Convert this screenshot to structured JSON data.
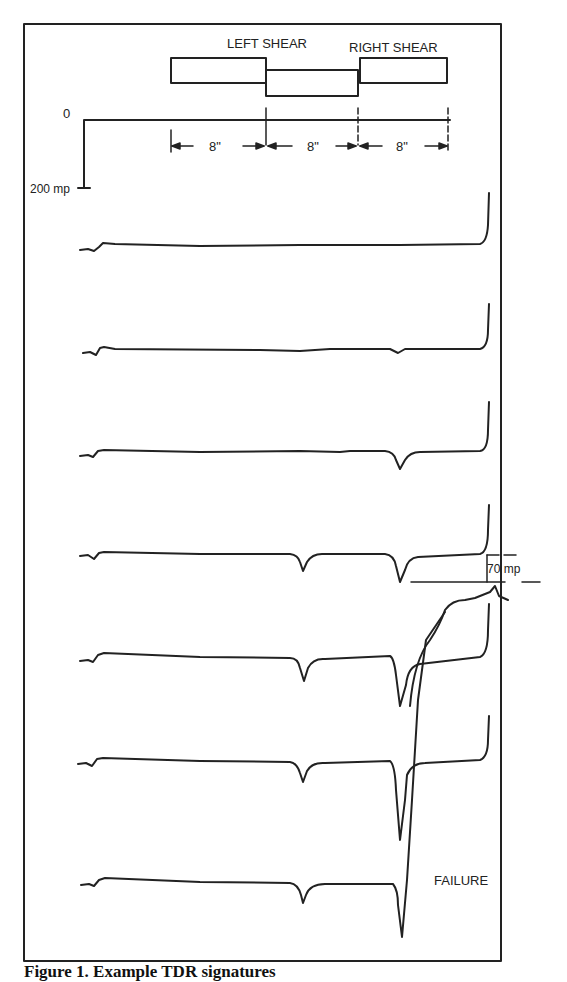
{
  "labels": {
    "left_shear": "LEFT SHEAR",
    "right_shear": "RIGHT SHEAR",
    "zero": "0",
    "scale_200": "200 mp",
    "dim1": "8\"",
    "dim2": "8\"",
    "dim3": "8\"",
    "scale_70": "70  mp",
    "failure": "FAILURE"
  },
  "caption": "Figure 1. Example TDR signatures",
  "colors": {
    "ink": "#222222",
    "background": "#ffffff"
  },
  "traces": [
    {
      "name": "trace-1",
      "left_dip": 0,
      "right_dip": 0
    },
    {
      "name": "trace-2",
      "left_dip": 0,
      "right_dip": 3
    },
    {
      "name": "trace-3",
      "left_dip": 0,
      "right_dip": 18
    },
    {
      "name": "trace-4",
      "left_dip": 20,
      "right_dip": 28
    },
    {
      "name": "trace-5",
      "left_dip": 25,
      "right_dip": 55
    },
    {
      "name": "trace-6",
      "left_dip": 25,
      "right_dip": 80
    },
    {
      "name": "trace-7-failure",
      "left_dip": 22,
      "right_dip": 55
    }
  ]
}
